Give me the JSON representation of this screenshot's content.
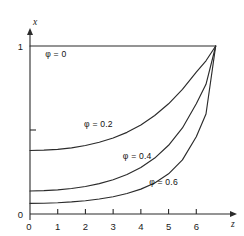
{
  "chart_data": {
    "type": "line",
    "title": "",
    "subtitle": "",
    "xlabel": "z",
    "ylabel": "x",
    "xlim": [
      0,
      7
    ],
    "ylim": [
      0,
      1.06
    ],
    "grid": false,
    "legend_position": "inline-annotations",
    "x_ticks": [
      0,
      1,
      2,
      3,
      4,
      5,
      6
    ],
    "x_tick_labels": [
      "0",
      "1",
      "2",
      "3",
      "4",
      "5",
      "6"
    ],
    "y_ticks": [
      0,
      0.5,
      1
    ],
    "y_tick_labels": [
      "0",
      "",
      "1"
    ],
    "y_major_labeled": [
      "0",
      "1"
    ],
    "series": [
      {
        "name": "φ = 0",
        "label": "φ = 0",
        "label_x": 0.55,
        "label_y": 0.935,
        "x": [
          0,
          1,
          2,
          3,
          4,
          5,
          6,
          6.7
        ],
        "values": [
          1,
          1,
          1,
          1,
          1,
          1,
          1,
          1
        ]
      },
      {
        "name": "φ = 0.2",
        "label": "φ = 0.2",
        "label_x": 1.95,
        "label_y": 0.515,
        "x": [
          0,
          0.5,
          1,
          1.5,
          2,
          2.5,
          3,
          3.5,
          4,
          4.5,
          5,
          5.5,
          6,
          6.35,
          6.7
        ],
        "values": [
          0.378,
          0.38,
          0.385,
          0.394,
          0.408,
          0.427,
          0.452,
          0.486,
          0.53,
          0.586,
          0.656,
          0.742,
          0.845,
          0.912,
          1.0
        ]
      },
      {
        "name": "φ = 0.4",
        "label": "φ = 0.4",
        "label_x": 3.35,
        "label_y": 0.325,
        "x": [
          0,
          0.5,
          1,
          1.5,
          2,
          2.5,
          3,
          3.5,
          4,
          4.5,
          5,
          5.5,
          6,
          6.35,
          6.7
        ],
        "values": [
          0.137,
          0.139,
          0.144,
          0.152,
          0.164,
          0.181,
          0.204,
          0.235,
          0.277,
          0.333,
          0.409,
          0.512,
          0.656,
          0.772,
          1.0
        ]
      },
      {
        "name": "φ = 0.6",
        "label": "φ = 0.6",
        "label_x": 4.3,
        "label_y": 0.175,
        "x": [
          0,
          0.5,
          1,
          1.5,
          2,
          2.5,
          3,
          3.5,
          4,
          4.5,
          5,
          5.5,
          6,
          6.35,
          6.7
        ],
        "values": [
          0.063,
          0.064,
          0.067,
          0.072,
          0.079,
          0.089,
          0.103,
          0.122,
          0.148,
          0.185,
          0.239,
          0.322,
          0.46,
          0.595,
          1.0
        ]
      }
    ],
    "colors": {
      "curve": "#2b2b2b",
      "axis": "#2b2b2b",
      "text": "#1a1a1a",
      "background": "#ffffff"
    }
  }
}
